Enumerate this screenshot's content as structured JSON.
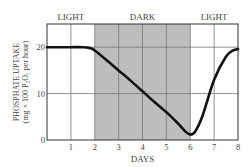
{
  "chart_data": {
    "type": "line",
    "title": "",
    "xlabel": "DAYS",
    "ylabel": "PHOSPHATE UPTAKE",
    "ylabel_units": "(mg × 100 P₂O₅ per hour)",
    "xlim": [
      0,
      8
    ],
    "ylim": [
      0,
      25
    ],
    "x_ticks": [
      "1",
      "2",
      "3",
      "4",
      "5",
      "6",
      "7",
      "8"
    ],
    "y_ticks": [
      "0",
      "10",
      "20"
    ],
    "grid": true,
    "legend": null,
    "period_labels": [
      {
        "label": "LIGHT",
        "from": 0,
        "to": 2
      },
      {
        "label": "DARK",
        "from": 2,
        "to": 6
      },
      {
        "label": "LIGHT",
        "from": 6,
        "to": 8
      }
    ],
    "shaded_region": {
      "from": 2,
      "to": 6,
      "color": "#bdbdbd"
    },
    "series": [
      {
        "name": "Phosphate uptake",
        "color": "#111111",
        "x": [
          0,
          0.5,
          1,
          1.5,
          1.8,
          2,
          2.5,
          3,
          3.5,
          4,
          4.5,
          5,
          5.5,
          5.8,
          6,
          6.2,
          6.5,
          7,
          7.5,
          7.8,
          8
        ],
        "values": [
          20,
          20,
          20,
          20,
          19.8,
          19.3,
          17.2,
          15,
          12.8,
          10.5,
          8.2,
          6,
          3.5,
          1.8,
          1.2,
          1.8,
          5,
          13,
          18,
          19.3,
          19.6
        ]
      }
    ]
  }
}
